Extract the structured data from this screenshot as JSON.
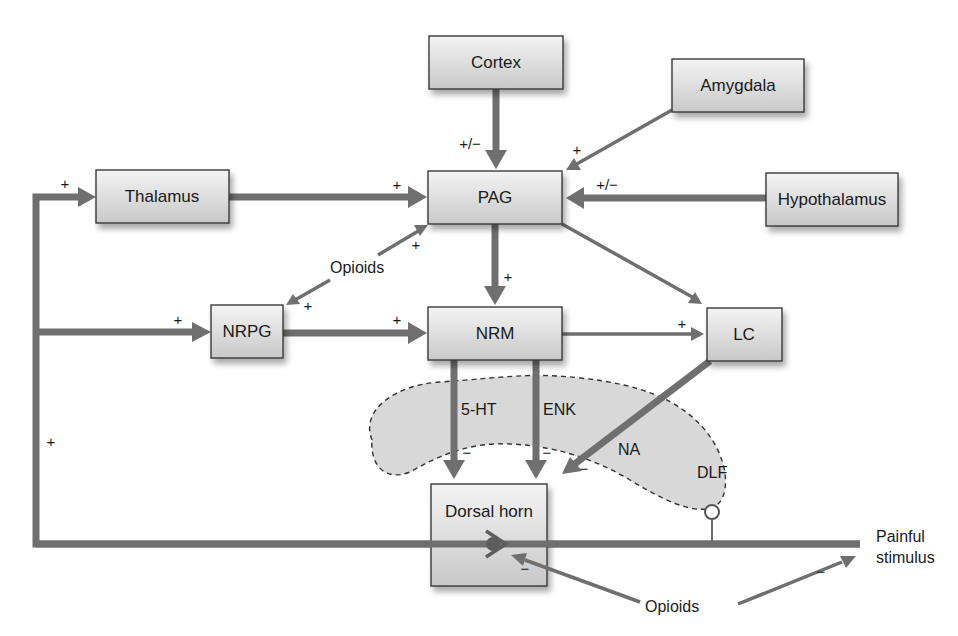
{
  "nodes": {
    "cortex": {
      "label": "Cortex",
      "x": 429,
      "y": 36,
      "w": 134,
      "h": 53
    },
    "amygdala": {
      "label": "Amygdala",
      "x": 672,
      "y": 59,
      "w": 132,
      "h": 53
    },
    "thalamus": {
      "label": "Thalamus",
      "x": 96,
      "y": 170,
      "w": 133,
      "h": 53
    },
    "pag": {
      "label": "PAG",
      "x": 428,
      "y": 171,
      "w": 134,
      "h": 53
    },
    "hypothalamus": {
      "label": "Hypothalamus",
      "x": 766,
      "y": 173,
      "w": 132,
      "h": 53
    },
    "nrpg": {
      "label": "NRPG",
      "x": 211,
      "y": 305,
      "w": 72,
      "h": 53
    },
    "nrm": {
      "label": "NRM",
      "x": 428,
      "y": 307,
      "w": 134,
      "h": 53
    },
    "lc": {
      "label": "LC",
      "x": 707,
      "y": 308,
      "w": 75,
      "h": 53
    },
    "dorsal_horn": {
      "label": "Dorsal horn",
      "x": 431,
      "y": 484,
      "w": 116,
      "h": 102
    }
  },
  "signs": {
    "cortex_pag": "+/−",
    "amygdala_pag": "+",
    "hypothalamus_pag": "+/−",
    "thalamus_pag": "+",
    "feedback_thalamus": "+",
    "opioids_pag": "+",
    "opioids_nrpg": "+",
    "pag_nrm": "+",
    "feedback_nrpg": "+",
    "nrpg_nrm": "+",
    "nrm_lc": "+",
    "feedback_vertical": "+",
    "fiveht_dh": "−",
    "enk_dh": "−",
    "na_dh": "−",
    "opioids_synapse": "−",
    "opioids_stimulus": "−"
  },
  "labels": {
    "opioids_upper": "Opioids",
    "opioids_lower": "Opioids",
    "five_ht": "5-HT",
    "enk": "ENK",
    "na": "NA",
    "dlf": "DLF",
    "painful": "Painful",
    "stimulus": "stimulus"
  },
  "colors": {
    "arrow": "#6f6f6f",
    "box_top": "#f2f2f2",
    "box_bottom": "#c9c9c9",
    "dlf_fill": "#d8d8d8",
    "text": "#1a1a1a"
  }
}
